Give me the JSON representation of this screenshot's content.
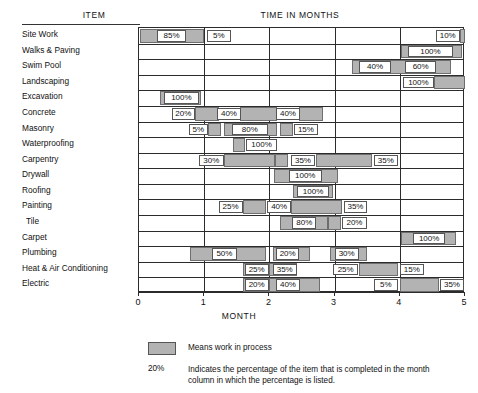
{
  "headers": {
    "item": "ITEM",
    "time": "TIME IN MONTHS",
    "month_axis": "MONTH"
  },
  "axis": {
    "ticks": [
      "0",
      "1",
      "2",
      "3",
      "4",
      "5"
    ],
    "min": 0,
    "max": 5
  },
  "legend": {
    "swatch_text": "Means work in process",
    "pct_sample": "20%",
    "pct_text": "Indicates the percentage of the item that is completed in the month column in which the percentage is listed."
  },
  "chart_data": {
    "type": "bar",
    "title": "TIME IN MONTHS",
    "xlabel": "MONTH",
    "ylabel": "ITEM",
    "xlim": [
      0,
      5
    ],
    "grid": true,
    "legend_position": "bottom",
    "categories": [
      "Site Work",
      "Walks & Paving",
      "Swim Pool",
      "Landscaping",
      "Excavation",
      "Concrete",
      "Masonry",
      "Waterproofing",
      "Carpentry",
      "Drywall",
      "Roofing",
      "Painting",
      "Tile",
      "Carpet",
      "Plumbing",
      "Heat & Air Conditioning",
      "Electric"
    ],
    "rows": [
      {
        "item": "Site Work",
        "bars": [
          {
            "start": 0.02,
            "end": 1.0
          },
          {
            "start": 4.93,
            "end": 5.0
          }
        ],
        "labels": [
          {
            "text": "85%",
            "left": 0.28,
            "right": 0.72
          },
          {
            "text": "5%",
            "right": null,
            "left": 1.04,
            "align": "left"
          },
          {
            "text": "10%",
            "left": 4.55,
            "right": 4.92,
            "align": "right"
          }
        ]
      },
      {
        "item": "Walks & Paving",
        "bars": [
          {
            "start": 4.02,
            "end": 4.95
          }
        ],
        "labels": [
          {
            "text": "100%",
            "left": 4.12,
            "right": 4.82
          }
        ]
      },
      {
        "item": "Swim Pool",
        "bars": [
          {
            "start": 3.27,
            "end": 4.78
          }
        ],
        "labels": [
          {
            "text": "40%",
            "left": 3.38,
            "right": 3.86
          },
          {
            "text": "60%",
            "left": 4.08,
            "right": 4.56
          }
        ]
      },
      {
        "item": "Landscaping",
        "bars": [
          {
            "start": 4.52,
            "end": 5.0
          }
        ],
        "labels": [
          {
            "text": "100%",
            "left": 4.05,
            "right": 4.52,
            "align": "right"
          }
        ]
      },
      {
        "item": "Excavation",
        "bars": [
          {
            "start": 0.32,
            "end": 0.95
          }
        ],
        "labels": [
          {
            "text": "100%",
            "left": 0.38,
            "right": 0.92
          }
        ]
      },
      {
        "item": "Concrete",
        "bars": [
          {
            "start": 0.86,
            "end": 1.22
          },
          {
            "start": 1.55,
            "end": 2.12
          },
          {
            "start": 2.46,
            "end": 2.82
          }
        ],
        "labels": [
          {
            "text": "20%",
            "left": 0.5,
            "right": 0.86,
            "align": "right"
          },
          {
            "text": "40%",
            "left": 1.2,
            "right": 1.56
          },
          {
            "text": "40%",
            "left": 2.1,
            "right": 2.47
          }
        ]
      },
      {
        "item": "Masonry",
        "bars": [
          {
            "start": 1.06,
            "end": 1.26
          },
          {
            "start": 1.3,
            "end": 2.12
          },
          {
            "start": 2.16,
            "end": 2.36
          }
        ],
        "labels": [
          {
            "text": "5%",
            "left": 0.76,
            "right": 1.06,
            "align": "right"
          },
          {
            "text": "80%",
            "left": 1.42,
            "right": 1.98
          },
          {
            "text": "15%",
            "left": 2.38,
            "right": 2.74,
            "align": "left"
          }
        ]
      },
      {
        "item": "Waterproofing",
        "bars": [
          {
            "start": 1.44,
            "end": 1.62
          }
        ],
        "labels": [
          {
            "text": "100%",
            "left": 1.64,
            "right": 2.12,
            "align": "left"
          }
        ]
      },
      {
        "item": "Carpentry",
        "bars": [
          {
            "start": 1.3,
            "end": 2.08
          },
          {
            "start": 2.08,
            "end": 2.28
          },
          {
            "start": 2.72,
            "end": 3.58
          }
        ],
        "labels": [
          {
            "text": "30%",
            "left": 0.92,
            "right": 1.3,
            "align": "right"
          },
          {
            "text": "35%",
            "left": 2.33,
            "right": 2.7
          },
          {
            "text": "35%",
            "left": 3.6,
            "right": 3.97,
            "align": "left"
          }
        ]
      },
      {
        "item": "Drywall",
        "bars": [
          {
            "start": 2.07,
            "end": 3.05
          }
        ],
        "labels": [
          {
            "text": "100%",
            "left": 2.3,
            "right": 2.8
          }
        ]
      },
      {
        "item": "Roofing",
        "bars": [
          {
            "start": 2.36,
            "end": 2.97
          }
        ],
        "labels": [
          {
            "text": "100%",
            "left": 2.42,
            "right": 2.92
          }
        ]
      },
      {
        "item": "Painting",
        "bars": [
          {
            "start": 1.59,
            "end": 1.95
          },
          {
            "start": 2.33,
            "end": 3.12
          }
        ],
        "labels": [
          {
            "text": "25%",
            "left": 1.22,
            "right": 1.59,
            "align": "right"
          },
          {
            "text": "40%",
            "left": 1.97,
            "right": 2.33
          },
          {
            "text": "35%",
            "left": 3.14,
            "right": 3.5,
            "align": "left"
          }
        ]
      },
      {
        "item": "Tile",
        "bars": [
          {
            "start": 2.17,
            "end": 2.9
          },
          {
            "start": 2.9,
            "end": 3.1
          }
        ],
        "labels": [
          {
            "text": "80%",
            "left": 2.35,
            "right": 2.72
          },
          {
            "text": "20%",
            "left": 3.12,
            "right": 3.49,
            "align": "left"
          }
        ]
      },
      {
        "item": "Carpet",
        "bars": [
          {
            "start": 4.02,
            "end": 4.86
          }
        ],
        "labels": [
          {
            "text": "100%",
            "left": 4.2,
            "right": 4.7
          }
        ]
      },
      {
        "item": "Plumbing",
        "bars": [
          {
            "start": 0.78,
            "end": 1.95
          },
          {
            "start": 2.06,
            "end": 2.62
          },
          {
            "start": 2.93,
            "end": 3.5
          }
        ],
        "labels": [
          {
            "text": "50%",
            "left": 1.12,
            "right": 1.5
          },
          {
            "text": "20%",
            "left": 2.1,
            "right": 2.46
          },
          {
            "text": "30%",
            "left": 3.0,
            "right": 3.37
          }
        ]
      },
      {
        "item": "Heat & Air Conditioning",
        "bars": [
          {
            "start": 1.6,
            "end": 2.0
          },
          {
            "start": 2.0,
            "end": 2.42
          },
          {
            "start": 3.38,
            "end": 3.98
          }
        ],
        "labels": [
          {
            "text": "25%",
            "left": 1.62,
            "right": 1.99
          },
          {
            "text": "35%",
            "left": 2.05,
            "right": 2.42
          },
          {
            "text": "25%",
            "left": 2.98,
            "right": 3.36,
            "align": "right"
          },
          {
            "text": "15%",
            "left": 4.0,
            "right": 4.37,
            "align": "left"
          }
        ]
      },
      {
        "item": "Electric",
        "bars": [
          {
            "start": 1.6,
            "end": 2.0
          },
          {
            "start": 2.0,
            "end": 2.78
          },
          {
            "start": 4.0,
            "end": 4.6
          }
        ],
        "labels": [
          {
            "text": "20%",
            "left": 1.62,
            "right": 1.99
          },
          {
            "text": "40%",
            "left": 2.1,
            "right": 2.47
          },
          {
            "text": "5%",
            "left": 3.6,
            "right": 3.97,
            "align": "right"
          },
          {
            "text": "35%",
            "left": 4.62,
            "right": 4.98,
            "align": "left"
          }
        ]
      }
    ]
  }
}
